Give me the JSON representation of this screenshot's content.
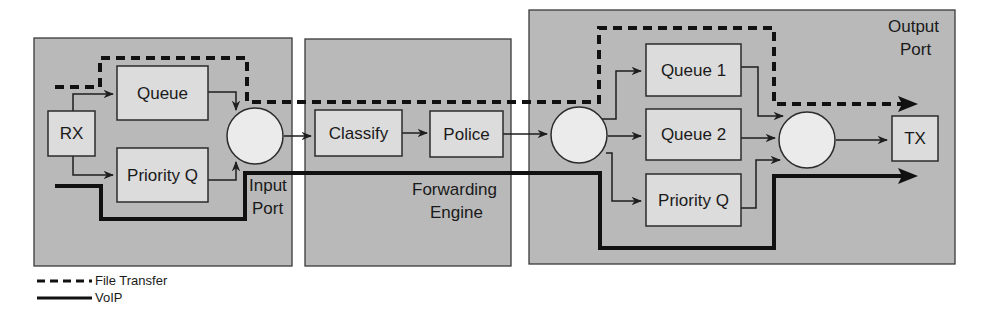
{
  "regions": {
    "input_port": {
      "label_line1": "Input",
      "label_line2": "Port"
    },
    "forwarding_engine": {
      "label_line1": "Forwarding",
      "label_line2": "Engine"
    },
    "output_port": {
      "label_line1": "Output",
      "label_line2": "Port"
    }
  },
  "nodes": {
    "rx": "RX",
    "input_queue": "Queue",
    "input_priority_q": "Priority Q",
    "classify": "Classify",
    "police": "Police",
    "queue1": "Queue 1",
    "queue2": "Queue 2",
    "output_priority_q": "Priority Q",
    "tx": "TX"
  },
  "legend": {
    "items": [
      {
        "style": "dashed",
        "label": "File Transfer"
      },
      {
        "style": "solid-thick",
        "label": "VoIP"
      }
    ]
  },
  "colors": {
    "region_fill": "#b9b9b9",
    "box_fill": "#dcdcdc",
    "circle_fill": "#ebebeb",
    "line": "#111111"
  }
}
